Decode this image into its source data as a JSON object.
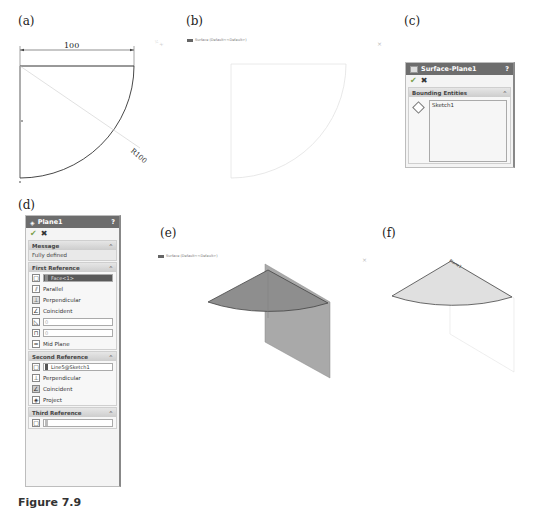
{
  "panels": {
    "a": {
      "label": "(a)",
      "dimension_width": "100",
      "dimension_radius": "R100"
    },
    "b": {
      "label": "(b)",
      "viewport_title": "Surface (Default<<Default>)"
    },
    "c": {
      "label": "(c)",
      "property_manager": {
        "title": "Surface-Plane1",
        "help": "?",
        "ok_icon": "check-icon",
        "cancel_icon": "close-icon",
        "section_title": "Bounding Entities",
        "section_collapse": "^",
        "list_items": [
          "Sketch1"
        ]
      }
    },
    "d": {
      "label": "(d)",
      "property_manager": {
        "title": "Plane1",
        "help": "?",
        "message_section": "Message",
        "message_text": "Fully defined",
        "first_reference": {
          "title": "First Reference",
          "selection": "Face<1>",
          "options": [
            "Parallel",
            "Perpendicular",
            "Coincident"
          ],
          "angle_value": "0",
          "distance_value": "0",
          "mid_plane": "Mid Plane"
        },
        "second_reference": {
          "title": "Second Reference",
          "selection": "Line5@Sketch1",
          "options": [
            "Perpendicular",
            "Coincident",
            "Project"
          ]
        },
        "third_reference": {
          "title": "Third Reference",
          "selection": ""
        }
      }
    },
    "e": {
      "label": "(e)",
      "viewport_title": "Surface (Default<<Default>)"
    },
    "f": {
      "label": "(f)",
      "plane_label": "Plane1"
    }
  },
  "caption": "Figure 7.9"
}
